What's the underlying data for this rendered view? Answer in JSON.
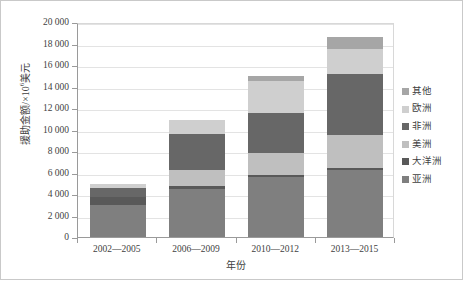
{
  "chart_data": {
    "type": "bar",
    "stacked": true,
    "title": "",
    "xlabel": "年份",
    "ylabel": "援助金额/×10⁶美元",
    "ylabel_main": "援助金额/×10",
    "ylabel_sup": "6",
    "ylabel_unit": "美元",
    "categories": [
      "2002—2005",
      "2006—2009",
      "2010—2012",
      "2013—2015"
    ],
    "ylim": [
      0,
      20000
    ],
    "ytick_step": 2000,
    "ytick_labels": [
      "20 000",
      "18 000",
      "16 000",
      "14 000",
      "12 000",
      "10 000",
      "8 000",
      "6 000",
      "4 000",
      "2 000",
      "0"
    ],
    "ytick_values": [
      20000,
      18000,
      16000,
      14000,
      12000,
      10000,
      8000,
      6000,
      4000,
      2000,
      0
    ],
    "grid": true,
    "legend_position": "right",
    "series": [
      {
        "name": "亚洲",
        "color": "#7f7f7f",
        "values": [
          3000,
          4500,
          5600,
          6200
        ]
      },
      {
        "name": "大洋洲",
        "color": "#595959",
        "values": [
          700,
          200,
          200,
          200
        ]
      },
      {
        "name": "美洲",
        "color": "#bfbfbf",
        "values": [
          0,
          1500,
          2000,
          3100
        ]
      },
      {
        "name": "非洲",
        "color": "#676767",
        "values": [
          900,
          3400,
          3700,
          5700
        ]
      },
      {
        "name": "欧洲",
        "color": "#cfcfcf",
        "values": [
          300,
          1300,
          3000,
          2300
        ]
      },
      {
        "name": "其他",
        "color": "#a6a6a6",
        "values": [
          0,
          0,
          500,
          1100
        ]
      }
    ],
    "totals": [
      4900,
      10900,
      15000,
      18600
    ],
    "legend_order": [
      "其他",
      "欧洲",
      "非洲",
      "美洲",
      "大洋洲",
      "亚洲"
    ]
  }
}
